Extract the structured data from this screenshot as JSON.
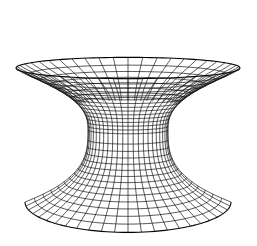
{
  "figure": {
    "line_color": "#111111",
    "background_color": "#ffffff",
    "meridian_count": 48,
    "parallel_count_upper": 14,
    "parallel_count_lower": 14
  }
}
